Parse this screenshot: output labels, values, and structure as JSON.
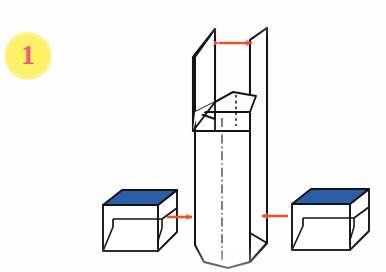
{
  "figure": {
    "step_number": "1"
  },
  "badge": {
    "label": "1",
    "shape": "circle-glow",
    "fill_color": "#fdf263",
    "text_color": "#e8607f"
  },
  "colors": {
    "ink": "#141414",
    "blue_face": "#2a5ea6",
    "blue_face_dark": "#1f4d8c",
    "arrow_red": "#f1502a",
    "paper": "#fefefe",
    "white_face": "#ffffff",
    "shade_face": "#fbfbfb"
  },
  "objects": [
    {
      "id": "center-prism",
      "name": "central-tall-prism",
      "faces": [
        {
          "name": "front-face",
          "color": "#ffffff"
        },
        {
          "name": "right-face",
          "color": "#fbfbfb"
        }
      ],
      "has_center_line": true,
      "center_line_style": "dash-dot"
    },
    {
      "id": "left-flap",
      "name": "left-open-flap",
      "color": "#ffffff"
    },
    {
      "id": "right-flap",
      "name": "right-open-flap",
      "color": "#2a5ea6"
    },
    {
      "id": "inner-partition",
      "name": "inner-partition-box",
      "hidden_edge_style": "dashed"
    },
    {
      "id": "left-box",
      "name": "left-small-box",
      "faces": [
        {
          "name": "top-face",
          "color": "#2a5ea6"
        },
        {
          "name": "front-face",
          "color": "#ffffff"
        },
        {
          "name": "right-face",
          "color": "#ffffff"
        }
      ]
    },
    {
      "id": "right-box",
      "name": "right-small-box",
      "faces": [
        {
          "name": "top-face",
          "color": "#2a5ea6"
        },
        {
          "name": "front-face",
          "color": "#ffffff"
        },
        {
          "name": "right-face",
          "color": "#ffffff"
        }
      ]
    }
  ],
  "arrows": [
    {
      "id": "width-arrow",
      "name": "top-width-double-arrow",
      "type": "double-headed",
      "orientation": "horizontal",
      "color": "#f1502a",
      "from": "left-flap-top",
      "to": "right-flap-top"
    },
    {
      "id": "left-insert-arrow",
      "name": "left-insert-arrow",
      "type": "single-headed",
      "orientation": "horizontal",
      "direction": "right",
      "color": "#f1502a",
      "from": "left-small-box",
      "to": "central-tall-prism"
    },
    {
      "id": "right-insert-arrow",
      "name": "right-insert-arrow",
      "type": "single-headed",
      "orientation": "horizontal",
      "direction": "left",
      "color": "#f1502a",
      "from": "right-small-box",
      "to": "central-tall-prism"
    }
  ]
}
